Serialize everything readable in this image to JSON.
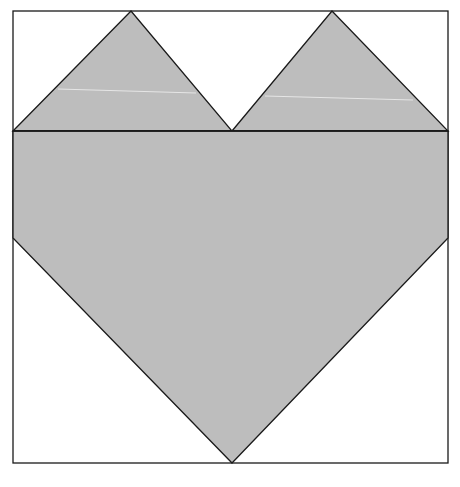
{
  "diagram": {
    "colors": {
      "background": "#ffffff",
      "fill": "#bdbdbd",
      "stroke": "#1a1a1a",
      "highlight": "#e6e6e6"
    },
    "outer_square": {
      "x": 13,
      "y": 11,
      "width": 435,
      "height": 452
    },
    "shapes": [
      {
        "name": "left-top-triangle",
        "points": "13,131 131,11 232,131"
      },
      {
        "name": "right-top-triangle",
        "points": "232,131 332,11 448,131"
      },
      {
        "name": "heart-body",
        "points": "13,131 448,131 448,238 232,463 13,238"
      }
    ],
    "lines": [
      {
        "name": "horizontal-divider",
        "x1": 13,
        "y1": 131,
        "x2": 448,
        "y2": 131
      }
    ]
  }
}
